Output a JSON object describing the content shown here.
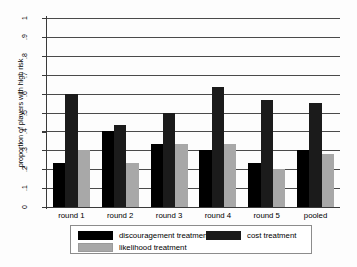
{
  "chart_data": {
    "type": "bar",
    "title": "",
    "subtitle": "",
    "xlabel": "",
    "ylabel": "proportion of players with high risk",
    "categories": [
      "round 1",
      "round 2",
      "round 3",
      "round 4",
      "round 5",
      "pooled"
    ],
    "series": [
      {
        "name": "discouragement treatment",
        "color": "#000000",
        "values": [
          0.233,
          0.4,
          0.333,
          0.3,
          0.233,
          0.3
        ]
      },
      {
        "name": "cost treatment",
        "color": "#1b1b1b",
        "values": [
          0.6,
          0.433,
          0.5,
          0.633,
          0.567,
          0.55
        ]
      },
      {
        "name": "likelihood treatment",
        "color": "#a8a8a8",
        "values": [
          0.3,
          0.233,
          0.333,
          0.333,
          0.2,
          0.28
        ]
      }
    ],
    "ylim": [
      0,
      1
    ],
    "ytick_labels": [
      "0",
      ".1",
      ".2",
      ".3",
      ".4",
      ".5",
      ".6",
      ".7",
      ".8",
      ".9",
      "1"
    ],
    "ytick_values": [
      0,
      0.1,
      0.2,
      0.3,
      0.4,
      0.5,
      0.6,
      0.7,
      0.8,
      0.9,
      1
    ],
    "grid": true,
    "grid_axis": "y",
    "legend_position": "bottom",
    "legend_entries": [
      "discouragement treatment",
      "cost treatment",
      "likelihood treatment"
    ]
  },
  "legend": {
    "items": [
      {
        "label": "discouragement treatment",
        "swatch": "s0"
      },
      {
        "label": "cost treatment",
        "swatch": "s1"
      },
      {
        "label": "likelihood treatment",
        "swatch": "s2"
      }
    ]
  }
}
